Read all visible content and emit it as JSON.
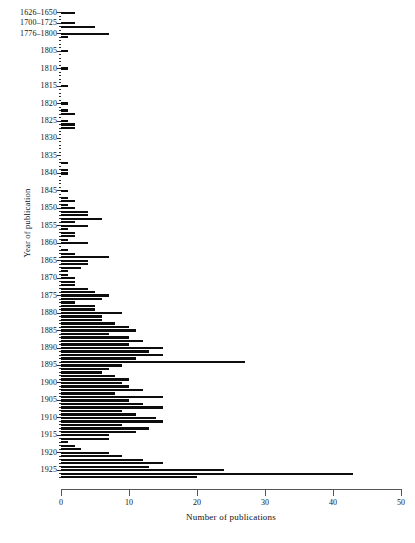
{
  "chart_data": {
    "type": "bar",
    "orientation": "horizontal",
    "title": "",
    "xlabel": "Number of publications",
    "ylabel": "Year of publication",
    "xlim": [
      0,
      50
    ],
    "xticks": [
      0,
      10,
      20,
      30,
      40,
      50
    ],
    "xtick_labels": [
      "0",
      "10",
      "20",
      "30",
      "40",
      "50"
    ],
    "grid": false,
    "legend": null,
    "bar_color": "#0d0d0d",
    "axis_color": "#555555",
    "categories": [
      "1626–1650",
      "1651–1675",
      "1676–1699",
      "1700–1725",
      "1726–1750",
      "1751–1775",
      "1776–1800",
      "1801",
      "1802",
      "1803",
      "1804",
      "1805",
      "1806",
      "1807",
      "1808",
      "1809",
      "1810",
      "1811",
      "1812",
      "1813",
      "1814",
      "1815",
      "1816",
      "1817",
      "1818",
      "1819",
      "1820",
      "1821",
      "1822",
      "1823",
      "1824",
      "1825",
      "1826",
      "1827",
      "1828",
      "1829",
      "1830",
      "1831",
      "1832",
      "1833",
      "1834",
      "1835",
      "1836",
      "1837",
      "1838",
      "1839",
      "1840",
      "1841",
      "1842",
      "1843",
      "1844",
      "1845",
      "1846",
      "1847",
      "1848",
      "1849",
      "1850",
      "1851",
      "1852",
      "1853",
      "1854",
      "1855",
      "1856",
      "1857",
      "1858",
      "1859",
      "1860",
      "1861",
      "1862",
      "1863",
      "1864",
      "1865",
      "1866",
      "1867",
      "1868",
      "1869",
      "1870",
      "1871",
      "1872",
      "1873",
      "1874",
      "1875",
      "1876",
      "1877",
      "1878",
      "1879",
      "1880",
      "1881",
      "1882",
      "1883",
      "1884",
      "1885",
      "1886",
      "1887",
      "1888",
      "1889",
      "1890",
      "1891",
      "1892",
      "1893",
      "1894",
      "1895",
      "1896",
      "1897",
      "1898",
      "1899",
      "1900",
      "1901",
      "1902",
      "1903",
      "1904",
      "1905",
      "1906",
      "1907",
      "1908",
      "1909",
      "1910",
      "1911",
      "1912",
      "1913",
      "1914",
      "1915",
      "1916",
      "1917",
      "1918",
      "1919",
      "1920",
      "1921",
      "1922",
      "1923",
      "1924",
      "1925",
      "1926",
      "1927"
    ],
    "values": [
      2,
      0,
      0,
      2,
      5,
      0,
      7,
      1,
      0,
      0,
      0,
      1,
      0,
      0,
      0,
      0,
      1,
      0,
      0,
      0,
      0,
      1,
      0,
      0,
      0,
      0,
      1,
      0,
      1,
      2,
      0,
      1,
      2,
      2,
      0,
      0,
      0,
      0,
      0,
      0,
      0,
      0,
      0,
      1,
      0,
      1,
      1,
      0,
      0,
      0,
      0,
      1,
      0,
      1,
      2,
      1,
      2,
      4,
      4,
      6,
      2,
      4,
      1,
      2,
      2,
      1,
      4,
      0,
      1,
      2,
      7,
      4,
      4,
      3,
      1,
      1,
      2,
      2,
      2,
      4,
      5,
      7,
      6,
      2,
      5,
      5,
      9,
      6,
      6,
      8,
      10,
      11,
      7,
      10,
      12,
      10,
      15,
      13,
      15,
      11,
      27,
      9,
      7,
      6,
      8,
      10,
      9,
      10,
      12,
      8,
      15,
      10,
      12,
      15,
      9,
      11,
      14,
      15,
      9,
      13,
      11,
      7,
      7,
      1,
      2,
      3,
      7,
      9,
      12,
      15,
      13,
      24,
      43,
      20
    ]
  },
  "axis": {
    "ylabel_text": "Year of publication",
    "xlabel_text": "Number of publications",
    "ytick_labels": [
      {
        "text": "1626–1650",
        "index": 0
      },
      {
        "text": "1700–1725",
        "index": 3
      },
      {
        "text": "1776–1800",
        "index": 6
      },
      {
        "text": "1805",
        "index": 11
      },
      {
        "text": "1810",
        "index": 16
      },
      {
        "text": "1815",
        "index": 21
      },
      {
        "text": "1820",
        "index": 26
      },
      {
        "text": "1825",
        "index": 31
      },
      {
        "text": "1830",
        "index": 36
      },
      {
        "text": "1835",
        "index": 41
      },
      {
        "text": "1840",
        "index": 46
      },
      {
        "text": "1845",
        "index": 51
      },
      {
        "text": "1850",
        "index": 56
      },
      {
        "text": "1855",
        "index": 61
      },
      {
        "text": "1860",
        "index": 66
      },
      {
        "text": "1865",
        "index": 71
      },
      {
        "text": "1870",
        "index": 76
      },
      {
        "text": "1875",
        "index": 81
      },
      {
        "text": "1880",
        "index": 86
      },
      {
        "text": "1885",
        "index": 91
      },
      {
        "text": "1890",
        "index": 96
      },
      {
        "text": "1895",
        "index": 101
      },
      {
        "text": "1900",
        "index": 106
      },
      {
        "text": "1905",
        "index": 111
      },
      {
        "text": "1910",
        "index": 116
      },
      {
        "text": "1915",
        "index": 121
      },
      {
        "text": "1920",
        "index": 126
      },
      {
        "text": "1925",
        "index": 131
      }
    ]
  }
}
